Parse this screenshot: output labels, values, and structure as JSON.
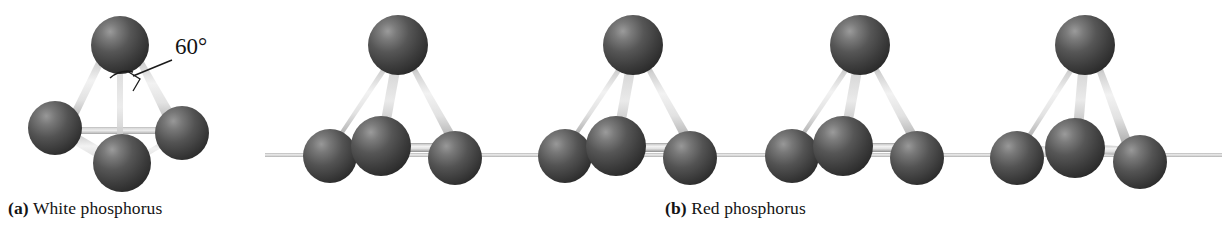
{
  "figure": {
    "type": "molecular-structure-illustration",
    "background": "#ffffff",
    "atom_color": "#4a4a4a",
    "atom_highlight_color": "#8e8e8e",
    "atom_shadow_color": "#2b2b2b",
    "bond_color": "#dcdcdc",
    "bond_edge_color": "#9a9a9a",
    "chain_line_color": "#c9c9c9",
    "text_color": "#141414"
  },
  "panels": [
    {
      "id": "a",
      "label": "(a)",
      "title": "White phosphorus",
      "caption_full": "(a) White phosphorus",
      "annotation": {
        "text": "60°",
        "kind": "bond-angle-callout"
      }
    },
    {
      "id": "b",
      "label": "(b)",
      "title": "Red phosphorus",
      "caption_full": "(b) Red phosphorus",
      "annotation": null
    }
  ],
  "captions": {
    "a_label": "(a)",
    "a_text": "White phosphorus",
    "b_label": "(b)",
    "b_text": "Red phosphorus"
  },
  "annotations": {
    "angle_label": "60°"
  },
  "structures": {
    "white_phosphorus": {
      "description": "P4 tetrahedron",
      "atom_count": 4,
      "atoms": [
        {
          "name": "p-top",
          "cx": 120,
          "cy": 45,
          "r": 29
        },
        {
          "name": "p-left",
          "cx": 55,
          "cy": 128,
          "r": 27
        },
        {
          "name": "p-right",
          "cx": 182,
          "cy": 133,
          "r": 27
        },
        {
          "name": "p-front",
          "cx": 122,
          "cy": 163,
          "r": 29
        }
      ],
      "bonds": [
        {
          "from": "p-top",
          "to": "p-left",
          "style": "solid"
        },
        {
          "from": "p-top",
          "to": "p-right",
          "style": "solid"
        },
        {
          "from": "p-top",
          "to": "p-front",
          "style": "solid"
        },
        {
          "from": "p-left",
          "to": "p-front",
          "style": "solid"
        },
        {
          "from": "p-right",
          "to": "p-front",
          "style": "solid"
        },
        {
          "from": "p-left",
          "to": "p-right",
          "style": "hidden"
        }
      ]
    },
    "red_phosphorus": {
      "description": "Chain of linked P tetrahedral units",
      "unit_count": 4,
      "unit_spacing": 228,
      "unit_origins": [
        398,
        633,
        860,
        1085
      ],
      "chain_line_y": 156,
      "chain_x_start": 265,
      "chain_x_end": 1222,
      "unit_atoms": [
        {
          "name": "p-apex",
          "dx": 0,
          "dy": 45,
          "r": 30
        },
        {
          "name": "p-center",
          "dx": -17,
          "dy": 146,
          "r": 30
        },
        {
          "name": "p-left",
          "dx": -68,
          "dy": 156,
          "r": 27
        },
        {
          "name": "p-right",
          "dx": 57,
          "dy": 158,
          "r": 27
        }
      ]
    }
  }
}
